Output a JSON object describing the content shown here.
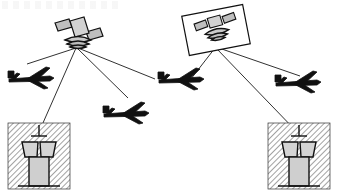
{
  "figure": {
    "title": "",
    "type": "satellite-communication-network-diagram",
    "background_color": "#ffffff",
    "stroke_color": "#000000",
    "fill_light": "#d9d9d9",
    "fill_mid": "#c4c4c4",
    "hatch_color": "#7a7a7a"
  },
  "satellites": [
    {
      "id": "satellite-left",
      "name": "satellite-left",
      "boxed": false,
      "position": {
        "x": 78,
        "y": 30
      },
      "has_solar_panels": true,
      "panel_count": 2,
      "has_signal_waves": true,
      "wave_arcs": 3,
      "link_count": 4
    },
    {
      "id": "satellite-right",
      "name": "satellite-right",
      "boxed": true,
      "position": {
        "x": 215,
        "y": 30
      },
      "has_solar_panels": true,
      "panel_count": 2,
      "has_signal_waves": true,
      "wave_arcs": 3,
      "link_count": 3,
      "box_rotation_deg": -11
    }
  ],
  "aircraft": [
    {
      "id": "aircraft-1",
      "name": "aircraft-upper-left",
      "position": {
        "x": 30,
        "y": 78
      },
      "heading": "left"
    },
    {
      "id": "aircraft-2",
      "name": "aircraft-lower-middle",
      "position": {
        "x": 123,
        "y": 112
      },
      "heading": "left"
    },
    {
      "id": "aircraft-3",
      "name": "aircraft-middle-right",
      "position": {
        "x": 178,
        "y": 78
      },
      "heading": "left"
    },
    {
      "id": "aircraft-4",
      "name": "aircraft-upper-right",
      "position": {
        "x": 295,
        "y": 82
      },
      "heading": "left"
    }
  ],
  "ground_stations": [
    {
      "id": "ground-station-left",
      "name": "control-tower-left",
      "region": {
        "x": 8,
        "y": 123,
        "width": 62,
        "height": 66
      },
      "hatched": true,
      "tower": {
        "has_antenna": true,
        "cabin_segments": 2,
        "shaft": true,
        "base": true
      }
    },
    {
      "id": "ground-station-right",
      "name": "control-tower-right",
      "region": {
        "x": 268,
        "y": 123,
        "width": 62,
        "height": 66
      },
      "hatched": true,
      "tower": {
        "has_antenna": true,
        "cabin_segments": 2,
        "shaft": true,
        "base": true
      }
    }
  ],
  "links": [
    {
      "id": "link-1",
      "name": "link-satellite-left-to-aircraft-1",
      "from": "satellite-left",
      "to": "aircraft-1"
    },
    {
      "id": "link-2",
      "name": "link-satellite-left-to-ground-left",
      "from": "satellite-left",
      "to": "ground-station-left"
    },
    {
      "id": "link-3",
      "name": "link-satellite-left-to-aircraft-2",
      "from": "satellite-left",
      "to": "aircraft-2"
    },
    {
      "id": "link-4",
      "name": "link-satellite-left-to-aircraft-3",
      "from": "satellite-left",
      "to": "aircraft-3"
    },
    {
      "id": "link-5",
      "name": "link-satellite-right-to-aircraft-3",
      "from": "satellite-right",
      "to": "aircraft-3"
    },
    {
      "id": "link-6",
      "name": "link-satellite-right-to-aircraft-4",
      "from": "satellite-right",
      "to": "aircraft-4"
    },
    {
      "id": "link-7",
      "name": "link-satellite-right-to-ground-right",
      "from": "satellite-right",
      "to": "ground-station-right"
    }
  ]
}
